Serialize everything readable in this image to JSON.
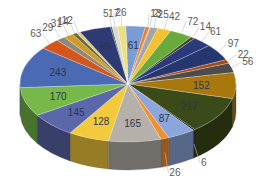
{
  "chart_data": {
    "type": "pie",
    "style": "3d-exploded-none",
    "title": "",
    "legend": "none",
    "slices": [
      {
        "value": 61,
        "color": "#7b9bd4",
        "label_pos": "inside"
      },
      {
        "value": 13,
        "color": "#ee7f2d",
        "label_pos": "outside"
      },
      {
        "value": 2,
        "color": "#c9c9c9",
        "label_pos": "outside"
      },
      {
        "value": 25,
        "color": "#a5a5a5",
        "label_pos": "outside"
      },
      {
        "value": 42,
        "color": "#f2c232",
        "label_pos": "outside"
      },
      {
        "value": 72,
        "color": "#6aaa3c",
        "label_pos": "outside"
      },
      {
        "value": 14,
        "color": "#3e4c2a",
        "label_pos": "outside"
      },
      {
        "value": 61,
        "color": "#2a3a7a",
        "label_pos": "outside"
      },
      {
        "value": 97,
        "color": "#26366e",
        "label_pos": "outside"
      },
      {
        "value": 22,
        "color": "#a8481a",
        "label_pos": "outside"
      },
      {
        "value": 56,
        "color": "#4c4c4c",
        "label_pos": "outside"
      },
      {
        "value": 152,
        "color": "#a8780e",
        "label_pos": "inside"
      },
      {
        "value": 217,
        "color": "#3a4a18",
        "label_pos": "inside"
      },
      {
        "value": 6,
        "color": "#111111",
        "label_pos": "outside"
      },
      {
        "value": 87,
        "color": "#8aa6dc",
        "label_pos": "inside"
      },
      {
        "value": 26,
        "color": "#f0902e",
        "label_pos": "outside"
      },
      {
        "value": 165,
        "color": "#b5b1aa",
        "label_pos": "inside"
      },
      {
        "value": 128,
        "color": "#f2ca3c",
        "label_pos": "inside"
      },
      {
        "value": 145,
        "color": "#5a68aa",
        "label_pos": "inside"
      },
      {
        "value": 170,
        "color": "#76b84a",
        "label_pos": "inside"
      },
      {
        "value": 243,
        "color": "#4a6ab4",
        "label_pos": "inside"
      },
      {
        "value": 63,
        "color": "#d4561c",
        "label_pos": "outside"
      },
      {
        "value": 29,
        "color": "#8a8a7a",
        "label_pos": "outside"
      },
      {
        "value": 31,
        "color": "#d09a2a",
        "label_pos": "outside"
      },
      {
        "value": 14,
        "color": "#5a6a44",
        "label_pos": "outside"
      },
      {
        "value": 12,
        "color": "#e6c87a",
        "label_pos": "outside"
      },
      {
        "value": 99,
        "color": "#2e3a74",
        "label_pos": "inside"
      },
      {
        "value": 5,
        "color": "#3e5a2e",
        "label_pos": "outside"
      },
      {
        "value": 17,
        "color": "#d8d8d8",
        "label_pos": "outside"
      },
      {
        "value": 26,
        "color": "#ece07a",
        "label_pos": "outside"
      }
    ],
    "label_values": [
      "61",
      "13",
      "2",
      "25",
      "42",
      "72",
      "14",
      "61",
      "97",
      "22",
      "56",
      "152",
      "217",
      "6",
      "87",
      "26",
      "165",
      "128",
      "145",
      "170",
      "243",
      "63",
      "29",
      "31",
      "14",
      "12",
      "99",
      "5",
      "17",
      "26"
    ]
  }
}
